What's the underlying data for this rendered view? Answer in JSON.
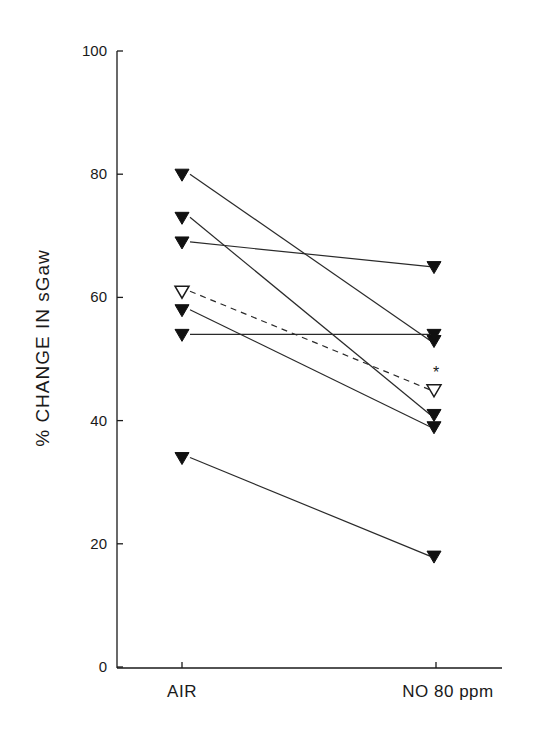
{
  "chart_data": {
    "type": "line",
    "title": "",
    "xlabel": "",
    "ylabel": "% CHANGE IN sGaw",
    "categories": [
      "AIR",
      "NO 80 ppm"
    ],
    "ylim": [
      0,
      100
    ],
    "yticks": [
      0,
      20,
      40,
      60,
      80,
      100
    ],
    "grid": false,
    "legend": null,
    "series": [
      {
        "name": "subject-1",
        "values": [
          80,
          53
        ],
        "marker": "filled-down-triangle",
        "line": "solid"
      },
      {
        "name": "subject-2",
        "values": [
          73,
          41
        ],
        "marker": "filled-down-triangle",
        "line": "solid"
      },
      {
        "name": "subject-3",
        "values": [
          69,
          65
        ],
        "marker": "filled-down-triangle",
        "line": "solid"
      },
      {
        "name": "subject-4",
        "values": [
          58,
          39
        ],
        "marker": "filled-down-triangle",
        "line": "solid"
      },
      {
        "name": "subject-5",
        "values": [
          54,
          54
        ],
        "marker": "filled-down-triangle",
        "line": "solid"
      },
      {
        "name": "subject-6",
        "values": [
          34,
          18
        ],
        "marker": "filled-down-triangle",
        "line": "solid"
      },
      {
        "name": "mean",
        "values": [
          61,
          45
        ],
        "marker": "open-down-triangle",
        "line": "dashed"
      }
    ],
    "annotations": [
      {
        "text": "*",
        "category": "NO 80 ppm",
        "y": 48.5,
        "note": "significance marker above mean"
      }
    ]
  },
  "axis": {
    "y_title": "% CHANGE IN sGaw",
    "y_tick_labels": [
      "0",
      "20",
      "40",
      "60",
      "80",
      "100"
    ],
    "x_tick_labels": [
      "AIR",
      "NO 80 ppm"
    ]
  },
  "annotation_text": "*"
}
